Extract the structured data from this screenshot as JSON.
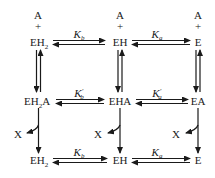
{
  "diagram": {
    "type": "kinetic-scheme",
    "rows": [
      {
        "substrate_above": [
          "A",
          "A",
          "A"
        ],
        "plus": [
          "+",
          "+",
          "+"
        ],
        "species": [
          {
            "base": "EH",
            "sub": "2",
            "suffix": ""
          },
          {
            "base": "EH",
            "sub": "",
            "suffix": ""
          },
          {
            "base": "E",
            "sub": "",
            "suffix": ""
          }
        ],
        "constants": [
          {
            "symbol": "K",
            "sub": "b",
            "prime": ""
          },
          {
            "symbol": "K",
            "sub": "a",
            "prime": ""
          }
        ]
      },
      {
        "species": [
          {
            "base": "EH",
            "sub": "2",
            "suffix": "A"
          },
          {
            "base": "EHA",
            "sub": "",
            "suffix": ""
          },
          {
            "base": "EA",
            "sub": "",
            "suffix": ""
          }
        ],
        "constants": [
          {
            "symbol": "K",
            "sub": "b",
            "prime": "′"
          },
          {
            "symbol": "K",
            "sub": "a",
            "prime": "′"
          }
        ]
      },
      {
        "species": [
          {
            "base": "EH",
            "sub": "2",
            "suffix": ""
          },
          {
            "base": "EH",
            "sub": "",
            "suffix": ""
          },
          {
            "base": "E",
            "sub": "",
            "suffix": ""
          }
        ],
        "constants": [
          {
            "symbol": "K",
            "sub": "b",
            "prime": ""
          },
          {
            "symbol": "K",
            "sub": "a",
            "prime": ""
          }
        ]
      }
    ],
    "product_label": "X",
    "vertical_links": [
      {
        "from": "EH2 + A",
        "to": "EH2A",
        "type": "equilibrium"
      },
      {
        "from": "EH + A",
        "to": "EHA",
        "type": "equilibrium"
      },
      {
        "from": "E + A",
        "to": "EA",
        "type": "equilibrium"
      },
      {
        "from": "EH2A",
        "to": "EH2",
        "type": "irreversible",
        "releases": "X"
      },
      {
        "from": "EHA",
        "to": "EH",
        "type": "irreversible",
        "releases": "X"
      },
      {
        "from": "EA",
        "to": "E",
        "type": "irreversible",
        "releases": "X"
      }
    ]
  }
}
